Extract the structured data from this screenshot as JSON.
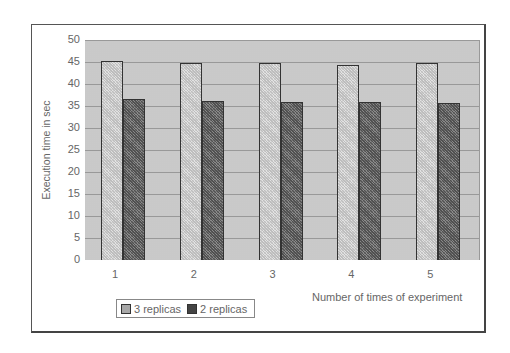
{
  "chart_data": {
    "type": "bar",
    "title": "",
    "xlabel": "Number of times of experiment",
    "ylabel": "Execution time in sec",
    "categories": [
      "1",
      "2",
      "3",
      "4",
      "5"
    ],
    "series": [
      {
        "name": "3 replicas",
        "values": [
          45.2,
          44.8,
          44.7,
          44.3,
          44.7
        ]
      },
      {
        "name": "2 replicas",
        "values": [
          36.6,
          36.1,
          36.0,
          35.9,
          35.6
        ]
      }
    ],
    "ylim": [
      0,
      50
    ],
    "yticks": [
      "0",
      "5",
      "10",
      "15",
      "20",
      "25",
      "30",
      "35",
      "40",
      "45",
      "50"
    ],
    "grid": true,
    "legend_position": "bottom-left"
  },
  "legend": {
    "items": [
      {
        "label": "3 replicas"
      },
      {
        "label": "2 replicas"
      }
    ]
  }
}
